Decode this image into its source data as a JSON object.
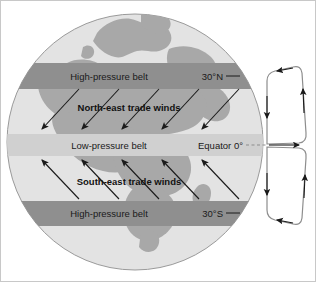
{
  "diagram": {
    "colors": {
      "background": "#ffffff",
      "globe_ocean": "#e3e3e3",
      "globe_land": "#a8a8a8",
      "belt_high_pressure": "#8f8f8f",
      "belt_low_pressure": "#d0d0d0",
      "globe_outline": "#9a9a9a",
      "arrow": "#1a1a1a",
      "cell_outline": "#8d8d8d",
      "text": "#1a1a1a",
      "border": "#c8c8c8"
    },
    "belts": [
      {
        "id": "high-pressure-north",
        "label": "High-pressure belt",
        "type": "high",
        "latitude_label": "30°N",
        "y_center": 75
      },
      {
        "id": "low-pressure-equator",
        "label": "Low-pressure belt",
        "type": "low",
        "latitude_label": "Equator 0°",
        "y_center": 144
      },
      {
        "id": "high-pressure-south",
        "label": "High-pressure belt",
        "type": "high",
        "latitude_label": "30°S",
        "y_center": 212
      }
    ],
    "wind_bands": [
      {
        "id": "north-east-trade-winds",
        "label": "North-east trade winds",
        "direction": "from north-east toward south-west",
        "arrow_count": 5,
        "label_x": 152,
        "label_y": 107
      },
      {
        "id": "south-east-trade-winds",
        "label": "South-east trade winds",
        "direction": "from south-east toward north-west",
        "arrow_count": 5,
        "label_x": 152,
        "label_y": 183
      }
    ],
    "circulation_cells": [
      {
        "id": "hadley-cell-north",
        "name": "Northern Hadley cell",
        "rotation": "counter-clockwise"
      },
      {
        "id": "hadley-cell-south",
        "name": "Southern Hadley cell",
        "rotation": "clockwise"
      }
    ],
    "latitude_ticks": [
      {
        "id": "tick-30n",
        "label": "30°N",
        "x": 232,
        "y": 78
      },
      {
        "id": "tick-equator",
        "label": "Equator 0°",
        "x": 232,
        "y": 147
      },
      {
        "id": "tick-30s",
        "label": "30°S",
        "x": 232,
        "y": 215
      }
    ]
  }
}
